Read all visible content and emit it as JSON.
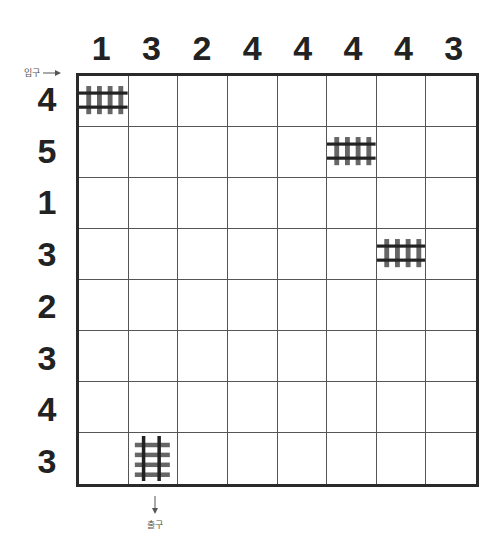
{
  "puzzle": {
    "type": "train-tracks",
    "grid_size": 8,
    "column_clues": [
      "1",
      "3",
      "2",
      "4",
      "4",
      "4",
      "4",
      "3"
    ],
    "row_clues": [
      "4",
      "5",
      "1",
      "3",
      "2",
      "3",
      "4",
      "3"
    ],
    "entry_label": "입구",
    "exit_label": "출구",
    "entry": {
      "row": 1,
      "col": 1,
      "direction": "right"
    },
    "exit": {
      "row": 8,
      "col": 2,
      "direction": "down"
    },
    "given_tracks": [
      {
        "row": 1,
        "col": 1,
        "orientation": "horizontal"
      },
      {
        "row": 2,
        "col": 6,
        "orientation": "horizontal"
      },
      {
        "row": 4,
        "col": 7,
        "orientation": "horizontal"
      },
      {
        "row": 8,
        "col": 2,
        "orientation": "vertical"
      }
    ]
  },
  "colors": {
    "rail": "#222222",
    "sleeper": "#666666",
    "grid_line": "#555555",
    "border": "#2a2a2a",
    "clue_text": "#222222"
  }
}
